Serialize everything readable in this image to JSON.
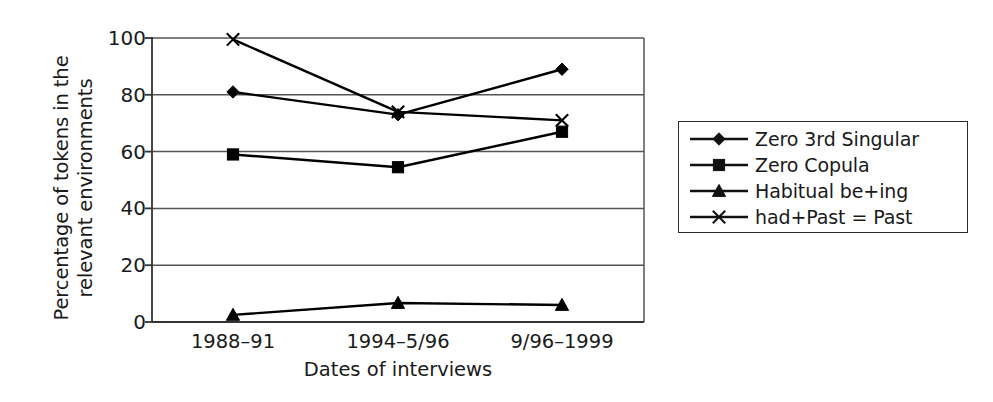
{
  "chart_data": {
    "type": "line",
    "title": "",
    "xlabel": "Dates of interviews",
    "ylabel_lines": [
      "Percentage of tokens in the",
      "relevant environments"
    ],
    "ylabel": "Percentage of tokens in the relevant environments",
    "categories": [
      "1988–91",
      "1994–5/96",
      "9/96–1999"
    ],
    "yticks": [
      0,
      20,
      40,
      60,
      80,
      100
    ],
    "ytick_labels": [
      "0",
      "20",
      "40",
      "60",
      "80",
      "100"
    ],
    "ylim": [
      0,
      100
    ],
    "grid": "horizontal",
    "legend_position": "right-outside",
    "series": [
      {
        "name": "Zero 3rd Singular",
        "marker": "diamond",
        "color": "#000000",
        "values": [
          81,
          73,
          89
        ]
      },
      {
        "name": "Zero Copula",
        "marker": "square",
        "color": "#000000",
        "values": [
          59,
          54.5,
          67
        ]
      },
      {
        "name": "Habitual be+ing",
        "marker": "triangle",
        "color": "#000000",
        "values": [
          2.5,
          6.7,
          6
        ]
      },
      {
        "name": "had+Past = Past",
        "marker": "cross",
        "color": "#000000",
        "values": [
          99.5,
          74,
          71
        ]
      }
    ]
  },
  "legend": {
    "items": [
      {
        "label": "Zero 3rd Singular",
        "marker": "diamond"
      },
      {
        "label": "Zero Copula",
        "marker": "square"
      },
      {
        "label": "Habitual be+ing",
        "marker": "triangle"
      },
      {
        "label": "had+Past = Past",
        "marker": "cross"
      }
    ]
  },
  "colors": {
    "line": "#111111",
    "grid": "#555555",
    "axis": "#333333",
    "background": "#ffffff",
    "text": "#1a1a1a"
  }
}
